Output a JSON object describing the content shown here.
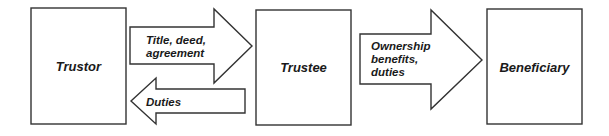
{
  "diagram": {
    "entities": [
      {
        "id": "trustor",
        "label": "Trustor"
      },
      {
        "id": "trustee",
        "label": "Trustee"
      },
      {
        "id": "beneficiary",
        "label": "Beneficiary"
      }
    ],
    "flows": [
      {
        "from": "trustor",
        "to": "trustee",
        "direction": "right",
        "lines": [
          "Title, deed,",
          "agreement"
        ]
      },
      {
        "from": "trustee",
        "to": "trustor",
        "direction": "left",
        "lines": [
          "Duties"
        ]
      },
      {
        "from": "trustee",
        "to": "beneficiary",
        "direction": "right",
        "lines": [
          "Ownership",
          "benefits,",
          "duties"
        ]
      }
    ],
    "colors": {
      "stroke": "#333333",
      "fill": "#ffffff",
      "text": "#1a1a1a"
    }
  }
}
